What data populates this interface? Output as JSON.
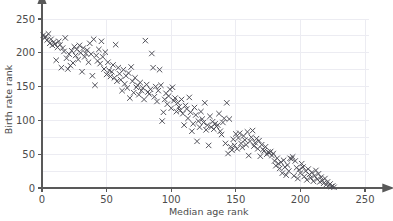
{
  "chart_data": {
    "type": "scatter",
    "title": "",
    "xlabel": "Median age rank",
    "ylabel": "Birth rate rank",
    "xlim": [
      0,
      258
    ],
    "ylim": [
      0,
      262
    ],
    "xticks": [
      0,
      50,
      100,
      150,
      200,
      250
    ],
    "yticks": [
      0,
      50,
      100,
      150,
      200,
      250
    ],
    "xtick_labels": [
      "0",
      "50",
      "100",
      "150",
      "200",
      "250"
    ],
    "ytick_labels": [
      "0",
      "50",
      "100",
      "150",
      "200",
      "250"
    ],
    "grid": true,
    "grid_color": "#ececf2",
    "axis_color": "#595959",
    "marker": "x",
    "marker_color": "#4a4a52",
    "marker_size": 3.2,
    "legend": null,
    "series": [
      {
        "name": "countries",
        "points": [
          [
            1,
            226
          ],
          [
            2,
            222
          ],
          [
            3,
            224
          ],
          [
            4,
            219
          ],
          [
            5,
            228
          ],
          [
            6,
            214
          ],
          [
            7,
            220
          ],
          [
            8,
            211
          ],
          [
            9,
            216
          ],
          [
            10,
            213
          ],
          [
            11,
            189
          ],
          [
            12,
            208
          ],
          [
            13,
            217
          ],
          [
            14,
            212
          ],
          [
            15,
            178
          ],
          [
            16,
            207
          ],
          [
            17,
            202
          ],
          [
            18,
            222
          ],
          [
            19,
            192
          ],
          [
            20,
            176
          ],
          [
            21,
            198
          ],
          [
            22,
            181
          ],
          [
            23,
            203
          ],
          [
            24,
            185
          ],
          [
            25,
            209
          ],
          [
            26,
            196
          ],
          [
            27,
            205
          ],
          [
            28,
            190
          ],
          [
            29,
            211
          ],
          [
            30,
            200
          ],
          [
            31,
            172
          ],
          [
            32,
            207
          ],
          [
            33,
            194
          ],
          [
            34,
            199
          ],
          [
            35,
            204
          ],
          [
            36,
            186
          ],
          [
            37,
            214
          ],
          [
            38,
            198
          ],
          [
            39,
            166
          ],
          [
            40,
            220
          ],
          [
            41,
            152
          ],
          [
            42,
            196
          ],
          [
            43,
            188
          ],
          [
            44,
            205
          ],
          [
            45,
            184
          ],
          [
            46,
            217
          ],
          [
            47,
            194
          ],
          [
            48,
            176
          ],
          [
            49,
            201
          ],
          [
            50,
            168
          ],
          [
            51,
            186
          ],
          [
            52,
            174
          ],
          [
            53,
            165
          ],
          [
            54,
            172
          ],
          [
            55,
            182
          ],
          [
            56,
            163
          ],
          [
            57,
            212
          ],
          [
            58,
            158
          ],
          [
            59,
            178
          ],
          [
            60,
            169
          ],
          [
            61,
            160
          ],
          [
            62,
            144
          ],
          [
            63,
            175
          ],
          [
            64,
            154
          ],
          [
            65,
            166
          ],
          [
            66,
            148
          ],
          [
            67,
            170
          ],
          [
            68,
            133
          ],
          [
            69,
            179
          ],
          [
            70,
            158
          ],
          [
            71,
            141
          ],
          [
            72,
            163
          ],
          [
            73,
            149
          ],
          [
            74,
            152
          ],
          [
            75,
            138
          ],
          [
            76,
            156
          ],
          [
            77,
            144
          ],
          [
            78,
            148
          ],
          [
            79,
            131
          ],
          [
            80,
            218
          ],
          [
            81,
            153
          ],
          [
            82,
            142
          ],
          [
            83,
            139
          ],
          [
            84,
            146
          ],
          [
            85,
            199
          ],
          [
            86,
            178
          ],
          [
            87,
            135
          ],
          [
            88,
            150
          ],
          [
            89,
            128
          ],
          [
            90,
            144
          ],
          [
            91,
            175
          ],
          [
            92,
            152
          ],
          [
            93,
            99
          ],
          [
            94,
            112
          ],
          [
            95,
            131
          ],
          [
            96,
            140
          ],
          [
            97,
            124
          ],
          [
            98,
            136
          ],
          [
            99,
            146
          ],
          [
            100,
            118
          ],
          [
            101,
            149
          ],
          [
            102,
            129
          ],
          [
            103,
            133
          ],
          [
            104,
            113
          ],
          [
            105,
            126
          ],
          [
            106,
            120
          ],
          [
            107,
            115
          ],
          [
            108,
            131
          ],
          [
            109,
            110
          ],
          [
            110,
            93
          ],
          [
            111,
            122
          ],
          [
            112,
            117
          ],
          [
            113,
            103
          ],
          [
            114,
            134
          ],
          [
            115,
            112
          ],
          [
            116,
            84
          ],
          [
            117,
            95
          ],
          [
            118,
            119
          ],
          [
            119,
            108
          ],
          [
            120,
            69
          ],
          [
            121,
            99
          ],
          [
            122,
            90
          ],
          [
            123,
            113
          ],
          [
            124,
            102
          ],
          [
            125,
            97
          ],
          [
            126,
            126
          ],
          [
            127,
            86
          ],
          [
            128,
            93
          ],
          [
            129,
            63
          ],
          [
            130,
            106
          ],
          [
            131,
            90
          ],
          [
            132,
            98
          ],
          [
            133,
            87
          ],
          [
            134,
            95
          ],
          [
            135,
            91
          ],
          [
            136,
            93
          ],
          [
            137,
            110
          ],
          [
            138,
            84
          ],
          [
            139,
            79
          ],
          [
            140,
            97
          ],
          [
            141,
            103
          ],
          [
            142,
            66
          ],
          [
            143,
            126
          ],
          [
            144,
            51
          ],
          [
            145,
            102
          ],
          [
            146,
            61
          ],
          [
            147,
            56
          ],
          [
            148,
            72
          ],
          [
            149,
            63
          ],
          [
            150,
            80
          ],
          [
            151,
            58
          ],
          [
            152,
            74
          ],
          [
            153,
            81
          ],
          [
            154,
            66
          ],
          [
            155,
            60
          ],
          [
            156,
            77
          ],
          [
            157,
            71
          ],
          [
            158,
            64
          ],
          [
            159,
            83
          ],
          [
            160,
            48
          ],
          [
            161,
            69
          ],
          [
            162,
            75
          ],
          [
            163,
            85
          ],
          [
            164,
            62
          ],
          [
            165,
            67
          ],
          [
            166,
            73
          ],
          [
            167,
            58
          ],
          [
            168,
            70
          ],
          [
            169,
            47
          ],
          [
            170,
            64
          ],
          [
            171,
            57
          ],
          [
            172,
            55
          ],
          [
            173,
            61
          ],
          [
            174,
            50
          ],
          [
            175,
            53
          ],
          [
            176,
            52
          ],
          [
            177,
            54
          ],
          [
            178,
            48
          ],
          [
            179,
            51
          ],
          [
            180,
            40
          ],
          [
            181,
            33
          ],
          [
            182,
            44
          ],
          [
            183,
            36
          ],
          [
            184,
            29
          ],
          [
            185,
            38
          ],
          [
            186,
            22
          ],
          [
            187,
            41
          ],
          [
            188,
            31
          ],
          [
            189,
            19
          ],
          [
            190,
            34
          ],
          [
            191,
            25
          ],
          [
            192,
            44
          ],
          [
            193,
            43
          ],
          [
            194,
            46
          ],
          [
            195,
            18
          ],
          [
            196,
            40
          ],
          [
            197,
            30
          ],
          [
            198,
            14
          ],
          [
            199,
            27
          ],
          [
            200,
            22
          ],
          [
            201,
            36
          ],
          [
            202,
            31
          ],
          [
            203,
            17
          ],
          [
            204,
            25
          ],
          [
            205,
            12
          ],
          [
            206,
            28
          ],
          [
            207,
            20
          ],
          [
            208,
            15
          ],
          [
            209,
            23
          ],
          [
            210,
            10
          ],
          [
            211,
            18
          ],
          [
            212,
            26
          ],
          [
            213,
            13
          ],
          [
            214,
            21
          ],
          [
            215,
            9
          ],
          [
            216,
            16
          ],
          [
            217,
            11
          ],
          [
            218,
            7
          ],
          [
            219,
            14
          ],
          [
            220,
            5
          ],
          [
            221,
            9
          ],
          [
            222,
            4
          ],
          [
            223,
            6
          ],
          [
            224,
            2
          ],
          [
            225,
            3
          ],
          [
            226,
            1
          ]
        ]
      }
    ]
  }
}
